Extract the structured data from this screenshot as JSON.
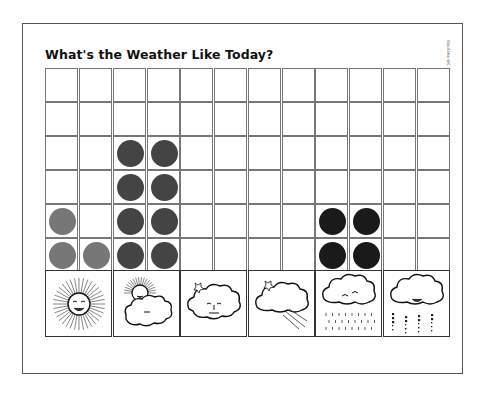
{
  "worksheet": {
    "title": "What's the Weather Like Today?",
    "side_label": "Blackline WC 4"
  },
  "colors": {
    "sunny": "#777777",
    "partly_cloudy": "#444444",
    "rainy": "#1a1a1a",
    "grid_line": "#777777"
  },
  "chart_data": {
    "type": "bar",
    "title": "What's the Weather Like Today?",
    "categories": [
      "Sunny",
      "Partly Cloudy",
      "Cloudy",
      "Windy",
      "Rainy",
      "Snowy"
    ],
    "category_icons": [
      "sun-icon",
      "sun-behind-cloud-icon",
      "cloud-icon",
      "wind-cloud-icon",
      "rain-cloud-icon",
      "snow-cloud-icon"
    ],
    "values": [
      3,
      8,
      0,
      0,
      4,
      0
    ],
    "ylim": [
      0,
      12
    ],
    "rows": 6,
    "cells_per_row": 2,
    "xlabel": "",
    "ylabel": "",
    "grid": true
  }
}
